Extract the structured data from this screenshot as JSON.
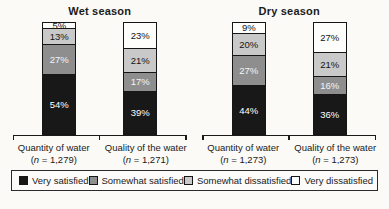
{
  "figure": {
    "background": "#fbfaf7"
  },
  "chart_data": {
    "type": "bar",
    "variant": "100-percent-stacked-column",
    "unit": "%",
    "value_suffix": "%",
    "grid": false,
    "legend_position": "bottom",
    "series": [
      {
        "name": "Very satisfied",
        "color": "#181818",
        "label_color": "#ffffff",
        "swatch_border": true
      },
      {
        "name": "Somewhat satisfied",
        "color": "#8e8e8e",
        "label_color": "#f5f5f5",
        "swatch_border": true
      },
      {
        "name": "Somewhat dissatisfied",
        "color": "#c9c9c9",
        "label_color": "#141414",
        "swatch_border": true
      },
      {
        "name": "Very dissatisfied",
        "color": "#fdfdfc",
        "label_color": "#141414",
        "swatch_border": true
      }
    ],
    "panels": [
      {
        "title": "Wet season",
        "bars": [
          {
            "category": "Quantity of water",
            "n_label": "(n = 1,279)",
            "values": [
              54,
              27,
              13,
              5
            ]
          },
          {
            "category": "Quality of the water",
            "n_label": "(n = 1,271)",
            "values": [
              39,
              17,
              21,
              23
            ]
          }
        ]
      },
      {
        "title": "Dry season",
        "bars": [
          {
            "category": "Quantity of water",
            "n_label": "(n = 1,273)",
            "values": [
              44,
              27,
              20,
              9
            ]
          },
          {
            "category": "Quality of the water",
            "n_label": "(n = 1,273)",
            "values": [
              36,
              16,
              21,
              27
            ]
          }
        ]
      }
    ]
  }
}
